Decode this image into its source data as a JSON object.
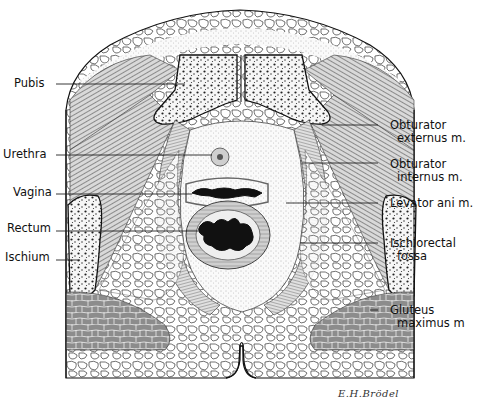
{
  "figure": {
    "signature": "E.H.Brödel"
  },
  "labels_left": [
    {
      "id": "pubis",
      "text": "Pubis",
      "y": 84
    },
    {
      "id": "urethra",
      "text": "Urethra",
      "y": 155
    },
    {
      "id": "vagina",
      "text": "Vagina",
      "y": 192
    },
    {
      "id": "rectum",
      "text": "Rectum",
      "y": 228
    },
    {
      "id": "ischium",
      "text": "Ischium",
      "y": 257
    }
  ],
  "labels_right": [
    {
      "id": "obturator-externus",
      "line1": "Obturator",
      "line2": "externus m.",
      "y": 123
    },
    {
      "id": "obturator-internus",
      "line1": "Obturator",
      "line2": "internus m.",
      "y": 162
    },
    {
      "id": "levator-ani",
      "line1": "Levator ani m.",
      "line2": "",
      "y": 203
    },
    {
      "id": "ischiorectal-fossa",
      "line1": "Ischiorectal",
      "line2": "fossa",
      "y": 243
    },
    {
      "id": "gluteus-maximus",
      "line1": "Gluteus",
      "line2": "maximus m",
      "y": 308
    }
  ],
  "colors": {
    "ink": "#1a1a1a",
    "muscle": "#7a7a7a",
    "bone_fill": "#f4f4f4",
    "background": "#ffffff"
  }
}
